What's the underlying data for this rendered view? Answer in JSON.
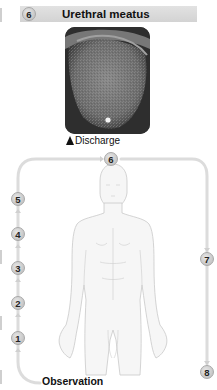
{
  "header": {
    "step_number": "6",
    "title": "Urethral meatus"
  },
  "photo": {
    "alt": "Close-up photograph of urethral meatus with discharge",
    "caption_marker": "triangle-marker",
    "caption": "Discharge"
  },
  "flow": {
    "steps": [
      {
        "number": "1",
        "label": ""
      },
      {
        "number": "2",
        "label": ""
      },
      {
        "number": "3",
        "label": ""
      },
      {
        "number": "4",
        "label": ""
      },
      {
        "number": "5",
        "label": ""
      },
      {
        "number": "6",
        "label": ""
      },
      {
        "number": "7",
        "label": ""
      },
      {
        "number": "8",
        "label": ""
      }
    ],
    "start_label": "Observation"
  },
  "colors": {
    "header_bar": "#d8d8d8",
    "circle_fill": "#c8c8c8",
    "path": "#dcdcdc",
    "text": "#111111"
  }
}
